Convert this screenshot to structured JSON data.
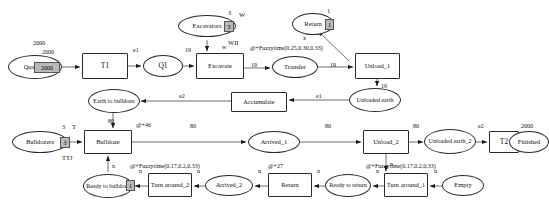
{
  "diagram": {
    "nodes": [
      {
        "id": "quantity",
        "label": "Quantity",
        "shape": "ellipse",
        "x": 8,
        "y": 55,
        "w": 54,
        "h": 24,
        "fs": 6.5
      },
      {
        "id": "t1",
        "label": "T1",
        "shape": "rect",
        "x": 82,
        "y": 53,
        "w": 46,
        "h": 26,
        "fs": 7.5
      },
      {
        "id": "q1",
        "label": "Q1",
        "shape": "ellipse",
        "x": 143,
        "y": 55,
        "w": 40,
        "h": 22,
        "fs": 7.5
      },
      {
        "id": "excavate",
        "label": "Excavate",
        "shape": "rect",
        "x": 196,
        "y": 53,
        "w": 48,
        "h": 26,
        "fs": 6.5
      },
      {
        "id": "excavators",
        "label": "Excavators",
        "shape": "ellipse",
        "x": 178,
        "y": 15,
        "w": 58,
        "h": 22,
        "fs": 6.5
      },
      {
        "id": "return_top",
        "label": "Return",
        "shape": "ellipse",
        "x": 292,
        "y": 13,
        "w": 42,
        "h": 22,
        "fs": 6.5
      },
      {
        "id": "transfer",
        "label": "Transfer",
        "shape": "ellipse",
        "x": 272,
        "y": 56,
        "w": 46,
        "h": 22,
        "fs": 6.5
      },
      {
        "id": "unload1",
        "label": "Unload_1",
        "shape": "rect",
        "x": 355,
        "y": 53,
        "w": 45,
        "h": 26,
        "fs": 6.5
      },
      {
        "id": "unloadedearth1",
        "label": "Unloaded earth",
        "shape": "ellipse",
        "x": 349,
        "y": 88,
        "w": 52,
        "h": 24,
        "fs": 6
      },
      {
        "id": "accumulate",
        "label": "Accumulate",
        "shape": "rect",
        "x": 231,
        "y": 92,
        "w": 56,
        "h": 20,
        "fs": 6.5
      },
      {
        "id": "earthtobulldoze",
        "label": "Earth to bulldoze",
        "shape": "ellipse",
        "x": 88,
        "y": 89,
        "w": 52,
        "h": 24,
        "fs": 6
      },
      {
        "id": "bulldozers",
        "label": "Bulldozers",
        "shape": "ellipse",
        "x": 12,
        "y": 131,
        "w": 56,
        "h": 22,
        "fs": 6.5
      },
      {
        "id": "bulldoze",
        "label": "Bulldoze",
        "shape": "rect",
        "x": 84,
        "y": 130,
        "w": 48,
        "h": 24,
        "fs": 6.5
      },
      {
        "id": "arrived1",
        "label": "Arrived_1",
        "shape": "ellipse",
        "x": 248,
        "y": 131,
        "w": 52,
        "h": 22,
        "fs": 6.5
      },
      {
        "id": "unload2",
        "label": "Unload_2",
        "shape": "rect",
        "x": 363,
        "y": 130,
        "w": 46,
        "h": 24,
        "fs": 6.5
      },
      {
        "id": "unloadedearth2",
        "label": "Unloaded earth_2",
        "shape": "ellipse",
        "x": 424,
        "y": 129,
        "w": 52,
        "h": 25,
        "fs": 6
      },
      {
        "id": "t2",
        "label": "T2",
        "shape": "rect",
        "x": 489,
        "y": 131,
        "w": 30,
        "h": 22,
        "fs": 7.5
      },
      {
        "id": "finished",
        "label": "Finished",
        "shape": "ellipse",
        "x": 509,
        "y": 131,
        "w": 40,
        "h": 22,
        "fs": 6.5
      },
      {
        "id": "readytobulldoze",
        "label": "Ready to bulldoze",
        "shape": "ellipse",
        "x": 83,
        "y": 174,
        "w": 50,
        "h": 24,
        "fs": 6
      },
      {
        "id": "turnaround2",
        "label": "Turn around_2",
        "shape": "rect",
        "x": 148,
        "y": 173,
        "w": 44,
        "h": 24,
        "fs": 6.5
      },
      {
        "id": "arrived2",
        "label": "Arrived_2",
        "shape": "ellipse",
        "x": 205,
        "y": 175,
        "w": 48,
        "h": 21,
        "fs": 6.5
      },
      {
        "id": "return_bot",
        "label": "Return",
        "shape": "rect",
        "x": 268,
        "y": 173,
        "w": 44,
        "h": 24,
        "fs": 6.5
      },
      {
        "id": "readytoreturn",
        "label": "Ready to return",
        "shape": "ellipse",
        "x": 325,
        "y": 174,
        "w": 46,
        "h": 23,
        "fs": 6
      },
      {
        "id": "turnaround1",
        "label": "Turn around_1",
        "shape": "rect",
        "x": 384,
        "y": 173,
        "w": 44,
        "h": 24,
        "fs": 6.5
      },
      {
        "id": "empty",
        "label": "Empty",
        "shape": "ellipse",
        "x": 442,
        "y": 175,
        "w": 42,
        "h": 21,
        "fs": 6.5
      }
    ],
    "tokens": [
      {
        "id": "tok-quantity",
        "value": "2000",
        "x": 34,
        "y": 62,
        "w": 24,
        "h": 9,
        "fs": 6
      },
      {
        "id": "tok-excavators",
        "value": "3",
        "x": 224,
        "y": 21,
        "w": 8,
        "h": 9,
        "fs": 6
      },
      {
        "id": "tok-return-top",
        "value": "1",
        "x": 325,
        "y": 19,
        "w": 7,
        "h": 9,
        "fs": 6
      },
      {
        "id": "tok-bulldozers",
        "value": "3",
        "x": 60,
        "y": 137,
        "w": 8,
        "h": 9,
        "fs": 6
      },
      {
        "id": "tok-readytobulldoze",
        "value": "1",
        "x": 126,
        "y": 180,
        "w": 7,
        "h": 9,
        "fs": 6
      }
    ],
    "labels": [
      {
        "id": "lbl-quantity-2000a",
        "text": "2000",
        "x": 33,
        "y": 40,
        "fs": 6
      },
      {
        "id": "lbl-quantity-2000b",
        "text": "2000",
        "x": 42,
        "y": 49,
        "fs": 6
      },
      {
        "id": "lbl-e1-top",
        "text": "e1",
        "x": 133,
        "y": 47,
        "fs": 6
      },
      {
        "id": "lbl-19-q1",
        "text": "19",
        "x": 185,
        "y": 47,
        "fs": 6
      },
      {
        "id": "lbl-w-top",
        "text": "W",
        "x": 239,
        "y": 11,
        "fs": 6.5
      },
      {
        "id": "lbl-3-excavators",
        "text": "3",
        "x": 228,
        "y": 10,
        "fs": 6
      },
      {
        "id": "lbl-wii",
        "text": "WII",
        "x": 228,
        "y": 39,
        "fs": 6.5
      },
      {
        "id": "lbl-w-arrow",
        "text": "w",
        "x": 222,
        "y": 44,
        "fs": 6
      },
      {
        "id": "lbl-1-return",
        "text": "1",
        "x": 327,
        "y": 8,
        "fs": 6
      },
      {
        "id": "lbl-x-return",
        "text": "x",
        "x": 303,
        "y": 35,
        "fs": 6
      },
      {
        "id": "lbl-fuzzy-top",
        "text": "@+Fuzzytime(0.25,0.30,0.33)",
        "x": 250,
        "y": 45,
        "fs": 6
      },
      {
        "id": "lbl-19-transfer",
        "text": "19",
        "x": 251,
        "y": 62,
        "fs": 6
      },
      {
        "id": "lbl-19-unload1",
        "text": "19",
        "x": 330,
        "y": 62,
        "fs": 6
      },
      {
        "id": "lbl-19-unloaded",
        "text": "19",
        "x": 381,
        "y": 83,
        "fs": 6
      },
      {
        "id": "lbl-e1-mid",
        "text": "e1",
        "x": 316,
        "y": 93,
        "fs": 6
      },
      {
        "id": "lbl-e2-mid",
        "text": "e2",
        "x": 179,
        "y": 93,
        "fs": 6
      },
      {
        "id": "lbl-80-bulldoze",
        "text": "80",
        "x": 108,
        "y": 118,
        "fs": 6
      },
      {
        "id": "lbl-fuzzy46",
        "text": "@+46",
        "x": 136,
        "y": 122,
        "fs": 6
      },
      {
        "id": "lbl-3-bulldozers",
        "text": "3",
        "x": 62,
        "y": 124,
        "fs": 6
      },
      {
        "id": "lbl-t-bulldozers",
        "text": "T",
        "x": 72,
        "y": 123,
        "fs": 6.5
      },
      {
        "id": "lbl-ttj",
        "text": "TTJ",
        "x": 62,
        "y": 154,
        "fs": 6.5
      },
      {
        "id": "lbl-80-arrived1",
        "text": "80",
        "x": 190,
        "y": 123,
        "fs": 6
      },
      {
        "id": "lbl-80-unload2",
        "text": "80",
        "x": 325,
        "y": 123,
        "fs": 6
      },
      {
        "id": "lbl-80-unloaded2",
        "text": "80",
        "x": 413,
        "y": 123,
        "fs": 6
      },
      {
        "id": "lbl-e2-right",
        "text": "e2",
        "x": 478,
        "y": 123,
        "fs": 6
      },
      {
        "id": "lbl-2000-finished",
        "text": "2000",
        "x": 521,
        "y": 123,
        "fs": 6
      },
      {
        "id": "lbl-n-bulldoze-down",
        "text": "n",
        "x": 112,
        "y": 163,
        "fs": 6
      },
      {
        "id": "lbl-n-turn2",
        "text": "n",
        "x": 139,
        "y": 168,
        "fs": 6
      },
      {
        "id": "lbl-n-arrived2",
        "text": "n",
        "x": 197,
        "y": 168,
        "fs": 6
      },
      {
        "id": "lbl-n-return-bot",
        "text": "n",
        "x": 258,
        "y": 168,
        "fs": 6
      },
      {
        "id": "lbl-n-readyreturn",
        "text": "n",
        "x": 317,
        "y": 168,
        "fs": 6
      },
      {
        "id": "lbl-n-turn1",
        "text": "n",
        "x": 376,
        "y": 168,
        "fs": 6
      },
      {
        "id": "lbl-n-empty",
        "text": "n",
        "x": 434,
        "y": 168,
        "fs": 6
      },
      {
        "id": "lbl-n-unload2-down",
        "text": "n",
        "x": 390,
        "y": 161,
        "fs": 6
      },
      {
        "id": "lbl-fuzzy-turn2",
        "text": "@+Fuzzytime(0.17,0.2,0.33)",
        "x": 130,
        "y": 163,
        "fs": 6
      },
      {
        "id": "lbl-fuzzy27",
        "text": "@+27",
        "x": 268,
        "y": 163,
        "fs": 6
      },
      {
        "id": "lbl-fuzzy-turn1",
        "text": "@+Fuzzytime(0.17,0.2,0.33)",
        "x": 366,
        "y": 163,
        "fs": 6
      }
    ]
  }
}
